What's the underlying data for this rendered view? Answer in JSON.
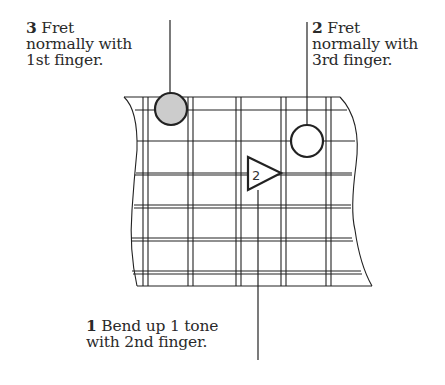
{
  "annotations": [
    {
      "id": "note-3",
      "number": "3",
      "line1": "Fret",
      "line2": "normally with",
      "line3": "1st finger."
    },
    {
      "id": "note-2",
      "number": "2",
      "line1": "Fret",
      "line2": "normally with",
      "line3": "3rd finger."
    },
    {
      "id": "note-1",
      "number": "1",
      "line1": "Bend up 1 tone",
      "line2": "with 2nd finger."
    }
  ],
  "markers": {
    "filled_circle": {
      "finger_step": "3",
      "fill": "#cccccc"
    },
    "open_circle": {
      "finger_step": "2",
      "fill": "#ffffff"
    },
    "bend_triangle": {
      "label": "2"
    }
  },
  "colors": {
    "line": "#222222",
    "filled_marker": "#cccccc",
    "background": "#ffffff"
  }
}
